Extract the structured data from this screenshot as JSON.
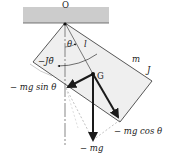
{
  "diagram": {
    "type": "compound-pendulum-free-body",
    "colors": {
      "ceiling_fill": "#cccccc",
      "body_fill": "#efefef",
      "outline": "#444444",
      "arrow": "#1a1a1a",
      "dashed": "#888888"
    },
    "labels": {
      "pivot": "O",
      "center_of_mass": "G",
      "mass": "m",
      "inertia": "J",
      "length": "l",
      "angle": "θ",
      "inertia_torque": "−Jθ̈",
      "tangential_force": "− mg sin θ",
      "normal_force": "− mg cos θ",
      "weight": "− mg"
    },
    "geometry": {
      "ceiling": {
        "x": 23,
        "y": 7,
        "w": 86,
        "h": 16
      },
      "pivot": [
        65,
        23
      ],
      "body": [
        [
          65,
          23
        ],
        [
          152,
          81
        ],
        [
          120,
          122
        ],
        [
          33,
          62
        ]
      ],
      "G": [
        93,
        74
      ],
      "weight_tip": [
        93,
        140
      ],
      "sin_tip": [
        66,
        88
      ],
      "cos_tip": [
        120,
        120
      ]
    }
  }
}
